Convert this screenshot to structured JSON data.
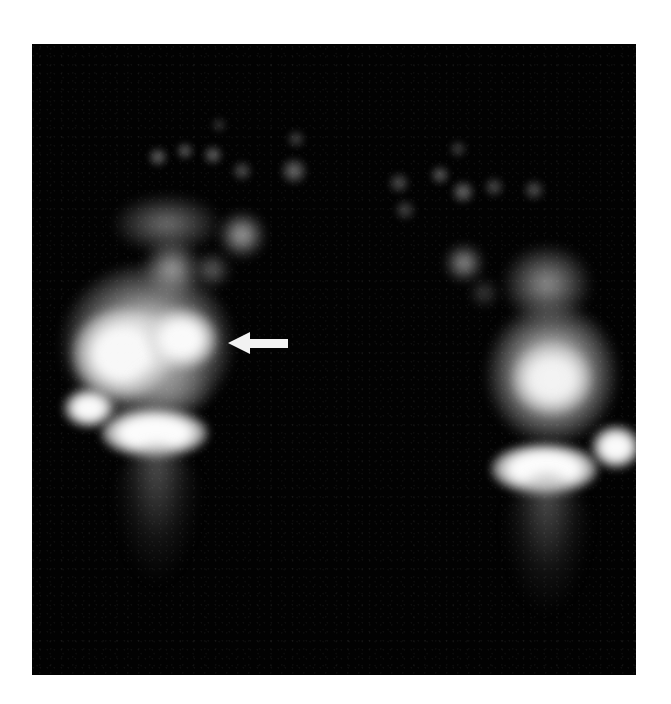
{
  "figure": {
    "type": "bone-scintigraphy",
    "view": "plantar-feet",
    "background_color": "#020202",
    "page_background": "#ffffff",
    "uptake_color": "#f4f4f4"
  },
  "annotations": {
    "arrow": {
      "direction": "left",
      "color": "#f2f2f2",
      "target": "left-foot-midfoot-uptake"
    }
  },
  "regions": {
    "left_foot": {
      "toes": 6,
      "hot_spots": [
        "midfoot",
        "navicular",
        "calcaneus",
        "medial-malleolus"
      ]
    },
    "right_foot": {
      "toes": 6,
      "hot_spots": [
        "midfoot",
        "calcaneus",
        "lateral-malleolus"
      ]
    }
  }
}
